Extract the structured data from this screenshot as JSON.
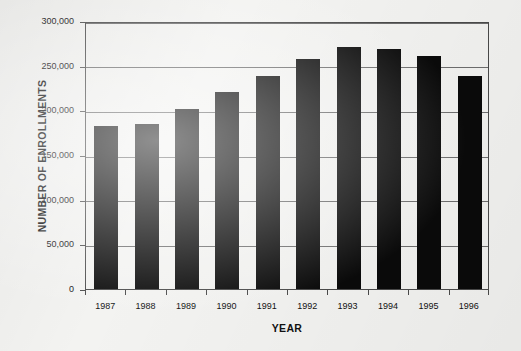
{
  "chart_data": {
    "type": "bar",
    "title": "",
    "xlabel": "YEAR",
    "ylabel": "NUMBER OF ENROLLMENTS",
    "categories": [
      "1987",
      "1988",
      "1989",
      "1990",
      "1991",
      "1992",
      "1993",
      "1994",
      "1995",
      "1996"
    ],
    "values": [
      183000,
      185000,
      201000,
      221000,
      238000,
      258000,
      271000,
      269000,
      261000,
      239000
    ],
    "ylim": [
      0,
      300000
    ],
    "yticks": [
      0,
      50000,
      100000,
      150000,
      200000,
      250000,
      300000
    ],
    "ytick_labels": [
      "0",
      "50,000",
      "100,000",
      "150,000",
      "200,000",
      "250,000",
      "300,000"
    ],
    "grid": true,
    "legend": false,
    "bar_color": "#0a0a0a",
    "axis_color": "#4a4a4a",
    "grid_color": "#6e6e6e",
    "background_color": "#f3f3f1"
  }
}
